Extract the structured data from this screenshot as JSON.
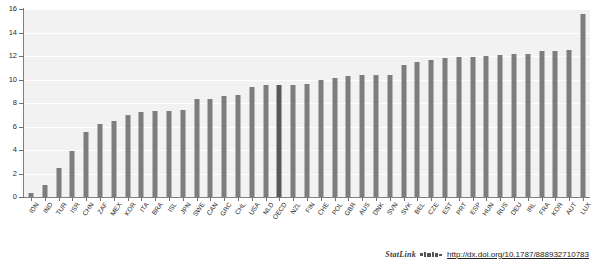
{
  "figure": {
    "statlink_label": "StatLink",
    "statlink_logo_name": "statlink-barcode-icon",
    "statlink_url": "http://dx.doi.org/10.1787/888932710783",
    "title_cutoff": "",
    "bar_color": "#7d7d7d",
    "highlight_color": "#585858",
    "plot_background": "#f2f2f2",
    "axis_color": "#808080"
  },
  "chart_data": {
    "type": "bar",
    "title": "",
    "subtitle": "",
    "xlabel": "",
    "ylabel": "",
    "ylim": [
      0,
      16
    ],
    "yticks": [
      0,
      2,
      4,
      6,
      8,
      10,
      12,
      14,
      16
    ],
    "ytick_labels": [
      "0",
      "2",
      "4",
      "6",
      "8",
      "10",
      "12",
      "14",
      "16"
    ],
    "grid": true,
    "legend": "none",
    "highlight_category": "OECD",
    "categories": [
      "IDN",
      "IND",
      "TUR",
      "ISR",
      "CHN",
      "ZAF",
      "MEX",
      "KOR",
      "ITA",
      "BRA",
      "ISL",
      "JPN",
      "SWE",
      "CAN",
      "GRC",
      "CHL",
      "USA",
      "NLD",
      "OECD",
      "NZL",
      "FIN",
      "CHE",
      "POL",
      "GBR",
      "AUS",
      "DNK",
      "SVN",
      "SVK",
      "BEL",
      "CZE",
      "EST",
      "PRT",
      "ESP",
      "HUN",
      "RUS",
      "DEU",
      "IRL",
      "FRA",
      "KOR",
      "AUT",
      "LUX"
    ],
    "values": [
      0.3,
      1.0,
      2.5,
      3.9,
      5.5,
      6.2,
      6.5,
      7.0,
      7.2,
      7.3,
      7.3,
      7.4,
      8.3,
      8.3,
      8.6,
      8.7,
      9.4,
      9.5,
      9.5,
      9.5,
      9.6,
      10.0,
      10.1,
      10.3,
      10.4,
      10.4,
      10.4,
      11.2,
      11.5,
      11.7,
      11.8,
      11.9,
      11.9,
      12.0,
      12.1,
      12.2,
      12.2,
      12.4,
      12.4,
      12.5,
      15.6
    ]
  }
}
